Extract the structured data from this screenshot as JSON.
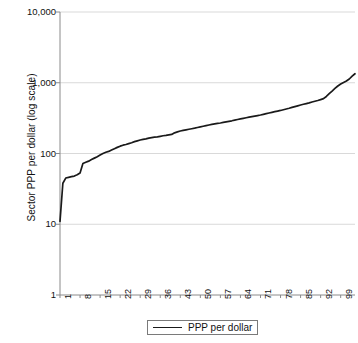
{
  "chart_data": {
    "type": "line",
    "title": "",
    "xlabel": "",
    "ylabel": "Sector PPP per dollar (log scale)",
    "y_scale": "log",
    "ylim": [
      1,
      10000
    ],
    "y_ticks": [
      "1",
      "10",
      "100",
      "1,000",
      "10,000"
    ],
    "y_tick_values": [
      1,
      10,
      100,
      1000,
      10000
    ],
    "x_ticks": [
      "1",
      "8",
      "15",
      "22",
      "29",
      "36",
      "43",
      "50",
      "57",
      "64",
      "71",
      "78",
      "85",
      "92",
      "99"
    ],
    "x_tick_values": [
      1,
      8,
      15,
      22,
      29,
      36,
      43,
      50,
      57,
      64,
      71,
      78,
      85,
      92,
      99
    ],
    "xlim": [
      1,
      104
    ],
    "grid": "horizontal",
    "legend_position": "bottom-center",
    "line_color": "#1a1a1a",
    "series": [
      {
        "name": "PPP per dollar",
        "x": [
          1,
          2,
          3,
          4,
          5,
          6,
          7,
          8,
          9,
          10,
          11,
          12,
          13,
          14,
          15,
          16,
          17,
          18,
          19,
          20,
          21,
          22,
          23,
          24,
          25,
          26,
          27,
          28,
          29,
          30,
          31,
          32,
          33,
          34,
          35,
          36,
          37,
          38,
          39,
          40,
          41,
          42,
          43,
          44,
          45,
          46,
          47,
          48,
          49,
          50,
          51,
          52,
          53,
          54,
          55,
          56,
          57,
          58,
          59,
          60,
          61,
          62,
          63,
          64,
          65,
          66,
          67,
          68,
          69,
          70,
          71,
          72,
          73,
          74,
          75,
          76,
          77,
          78,
          79,
          80,
          81,
          82,
          83,
          84,
          85,
          86,
          87,
          88,
          89,
          90,
          91,
          92,
          93,
          94,
          95,
          96,
          97,
          98,
          99,
          100,
          101,
          102,
          103,
          104
        ],
        "values": [
          11,
          38,
          45,
          46,
          47,
          48,
          50,
          53,
          72,
          75,
          78,
          82,
          86,
          90,
          95,
          100,
          104,
          107,
          112,
          117,
          122,
          127,
          131,
          134,
          138,
          142,
          147,
          151,
          155,
          158,
          161,
          165,
          168,
          170,
          172,
          175,
          178,
          180,
          183,
          186,
          196,
          202,
          208,
          212,
          216,
          220,
          224,
          228,
          233,
          238,
          243,
          248,
          253,
          258,
          262,
          266,
          270,
          275,
          280,
          285,
          290,
          296,
          302,
          308,
          314,
          320,
          326,
          332,
          338,
          344,
          350,
          358,
          366,
          374,
          382,
          390,
          398,
          406,
          416,
          426,
          436,
          448,
          460,
          472,
          484,
          496,
          508,
          520,
          534,
          548,
          562,
          578,
          596,
          640,
          700,
          760,
          830,
          900,
          960,
          1010,
          1060,
          1130,
          1240,
          1340
        ]
      }
    ]
  },
  "legend": {
    "entries": [
      {
        "label": "PPP per dollar",
        "icon": "line-swatch"
      }
    ]
  },
  "axes": {
    "y_title": "Sector PPP per dollar (log scale)"
  }
}
